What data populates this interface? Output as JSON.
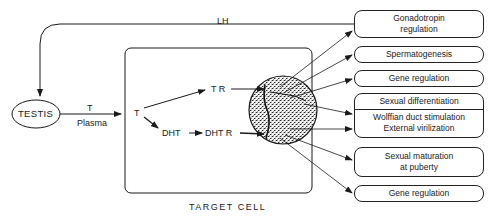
{
  "diagram": {
    "nodes": {
      "testis": "TESTIS",
      "lh": "LH",
      "plasma_t": "T",
      "plasma": "Plasma",
      "cell_t": "T",
      "tr": "T R",
      "dht": "DHT",
      "dhtr": "DHT R",
      "target_cell": "TARGET CELL"
    },
    "outcomes": [
      {
        "lines": [
          "Gonadotropin",
          "regulation"
        ]
      },
      {
        "lines": [
          "Spermatogenesis"
        ]
      },
      {
        "lines": [
          "Gene regulation"
        ]
      },
      {
        "lines": [
          "Sexual differentiation"
        ],
        "sub_lines": [
          "Wolffian duct stimulation",
          "External virilization"
        ]
      },
      {
        "lines": [
          "Sexual maturation",
          "at puberty"
        ]
      },
      {
        "lines": [
          "Gene regulation"
        ]
      }
    ],
    "edges": [
      {
        "from": "outcome-0",
        "to": "testis",
        "label": "LH"
      },
      {
        "from": "testis",
        "to": "target-cell",
        "label": "T / Plasma"
      },
      {
        "from": "cell_t",
        "to": "tr"
      },
      {
        "from": "cell_t",
        "to": "dht"
      },
      {
        "from": "dht",
        "to": "dhtr"
      },
      {
        "from": "tr",
        "to": "nucleus"
      },
      {
        "from": "dhtr",
        "to": "nucleus"
      },
      {
        "from": "nucleus",
        "to": "outcome-0"
      },
      {
        "from": "nucleus",
        "to": "outcome-1"
      },
      {
        "from": "nucleus",
        "to": "outcome-2"
      },
      {
        "from": "nucleus",
        "to": "outcome-3a"
      },
      {
        "from": "nucleus",
        "to": "outcome-3b"
      },
      {
        "from": "nucleus",
        "to": "outcome-4"
      },
      {
        "from": "nucleus",
        "to": "outcome-5"
      }
    ]
  }
}
